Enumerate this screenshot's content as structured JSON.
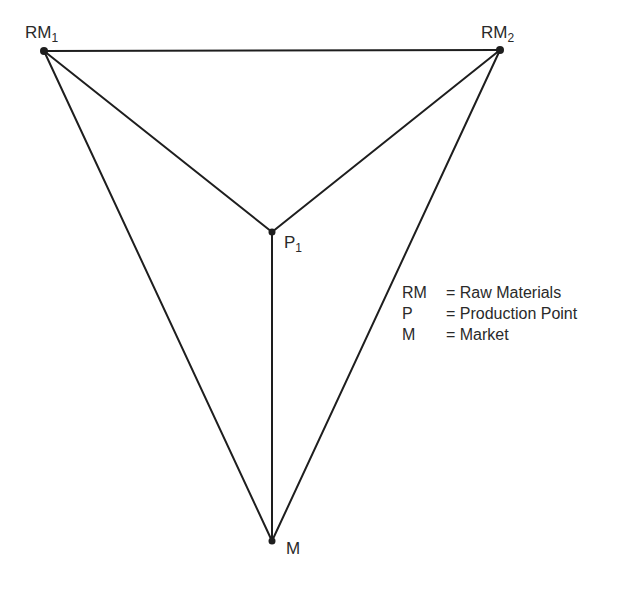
{
  "diagram": {
    "points": [
      {
        "id": "RM1",
        "label": "RM",
        "subscript": "1",
        "x": 44,
        "y": 51
      },
      {
        "id": "RM2",
        "label": "RM",
        "subscript": "2",
        "x": 500,
        "y": 50
      },
      {
        "id": "P1",
        "label": "P",
        "subscript": "1",
        "x": 272,
        "y": 232
      },
      {
        "id": "M",
        "label": "M",
        "subscript": "",
        "x": 272,
        "y": 541
      }
    ],
    "edges": [
      [
        "RM1",
        "RM2"
      ],
      [
        "RM1",
        "P1"
      ],
      [
        "RM2",
        "P1"
      ],
      [
        "P1",
        "M"
      ],
      [
        "RM1",
        "M"
      ],
      [
        "RM2",
        "M"
      ]
    ],
    "line_color": "#1e1e1e"
  },
  "labels": {
    "rm1": {
      "main": "RM",
      "sub": "1"
    },
    "rm2": {
      "main": "RM",
      "sub": "2"
    },
    "p1": {
      "main": "P",
      "sub": "1"
    },
    "m": {
      "main": "M"
    }
  },
  "legend": {
    "items": [
      {
        "key": "RM",
        "value": "= Raw Materials"
      },
      {
        "key": "P",
        "value": "= Production Point"
      },
      {
        "key": "M",
        "value": "= Market"
      }
    ]
  }
}
